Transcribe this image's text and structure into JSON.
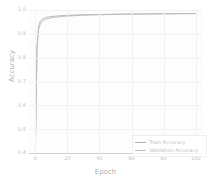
{
  "chart_data": {
    "type": "line",
    "title": "",
    "xlabel": "Epoch",
    "ylabel": "Accuracy",
    "xlim": [
      -4,
      104
    ],
    "ylim": [
      0.4,
      1.0
    ],
    "grid": true,
    "legend_position": "lower right",
    "xticks": [
      "0",
      "20",
      "40",
      "60",
      "80",
      "100"
    ],
    "xtick_values": [
      0,
      20,
      40,
      60,
      80,
      100
    ],
    "yticks": [
      "0.4",
      "0.5",
      "0.6",
      "0.7",
      "0.8",
      "0.9",
      "1.0"
    ],
    "ytick_values": [
      0.4,
      0.5,
      0.6,
      0.7,
      0.8,
      0.9,
      1.0
    ],
    "x": [
      0,
      1,
      2,
      3,
      4,
      5,
      6,
      7,
      8,
      9,
      10,
      12,
      14,
      16,
      18,
      20,
      25,
      30,
      35,
      40,
      45,
      50,
      55,
      60,
      65,
      70,
      75,
      80,
      85,
      90,
      95,
      100
    ],
    "series": [
      {
        "name": "Train Accuracy",
        "color": "#b0b0b0",
        "values": [
          0.418,
          0.845,
          0.93,
          0.952,
          0.96,
          0.964,
          0.967,
          0.969,
          0.9705,
          0.9715,
          0.9725,
          0.974,
          0.9752,
          0.9762,
          0.977,
          0.9777,
          0.979,
          0.98,
          0.9808,
          0.9815,
          0.982,
          0.9825,
          0.9829,
          0.9833,
          0.9836,
          0.9839,
          0.9842,
          0.9845,
          0.9847,
          0.9849,
          0.9851,
          0.9853
        ]
      },
      {
        "name": "Validation Accuracy",
        "color": "#bdbdbd",
        "values": [
          0.418,
          0.838,
          0.918,
          0.94,
          0.95,
          0.9555,
          0.9595,
          0.962,
          0.964,
          0.9655,
          0.9668,
          0.969,
          0.9708,
          0.9722,
          0.9734,
          0.9744,
          0.9764,
          0.9778,
          0.9789,
          0.9798,
          0.9805,
          0.9812,
          0.9817,
          0.9822,
          0.9826,
          0.983,
          0.9834,
          0.9837,
          0.984,
          0.9843,
          0.9845,
          0.9848
        ]
      }
    ]
  },
  "legend": {
    "entries": [
      {
        "label": "Train Accuracy"
      },
      {
        "label": "Validation Accuracy"
      }
    ]
  }
}
